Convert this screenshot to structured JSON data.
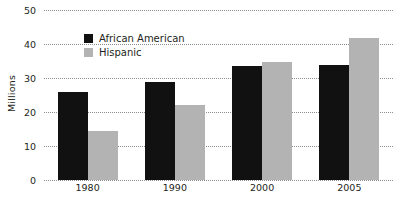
{
  "chart_data": {
    "type": "bar",
    "title": "",
    "xlabel": "",
    "ylabel": "Millions",
    "ylim": [
      0,
      50
    ],
    "yticks": [
      0,
      10,
      20,
      30,
      40,
      50
    ],
    "ytick_labels": [
      "0",
      "10",
      "20",
      "30",
      "40",
      "50"
    ],
    "grid": true,
    "grid_style": "dotted-horizontal",
    "legend_position": "inside-upper-left",
    "categories": [
      "1980",
      "1990",
      "2000",
      "2005"
    ],
    "series": [
      {
        "name": "African American",
        "color": "#111111",
        "values": [
          26.0,
          28.8,
          33.5,
          33.8
        ]
      },
      {
        "name": "Hispanic",
        "color": "#b3b3b3",
        "values": [
          14.5,
          22.2,
          34.6,
          41.8
        ]
      }
    ]
  },
  "colors": {
    "african_american": "#111111",
    "hispanic": "#b3b3b3",
    "gridline": "#8d8d8d",
    "text": "#231f20",
    "background": "#ffffff"
  }
}
